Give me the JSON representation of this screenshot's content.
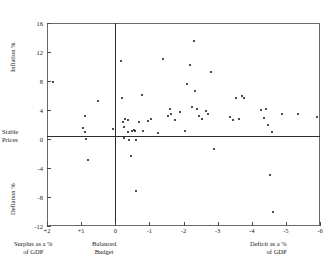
{
  "title": "",
  "axes": {
    "y_label_top": "Inflation %",
    "y_label_bottom": "Deflation %",
    "y_zero_label_line1": "Stable",
    "y_zero_label_line2": "Prices",
    "x_caption_left_line1": "Surplus as a %",
    "x_caption_left_line2": "of GDP",
    "x_caption_mid_line1": "Balanced",
    "x_caption_mid_line2": "Budget",
    "x_caption_right_line1": "Deficit as a %",
    "x_caption_right_line2": "of GDP",
    "x_ticks": [
      "+2",
      "+1",
      "0",
      "-1",
      "-2",
      "-3",
      "-4",
      "-5",
      "-6"
    ],
    "y_ticks": [
      "16",
      "12",
      "8",
      "4",
      "0",
      "-4",
      "-8",
      "-12"
    ]
  },
  "chart_data": {
    "type": "scatter",
    "title": "",
    "xlabel": "Budget balance as a % of GDP (surplus positive, deficit negative)",
    "ylabel": "Inflation / Deflation %",
    "xlim": [
      2,
      -6
    ],
    "ylim": [
      -12,
      16
    ],
    "x_ticks": [
      2,
      1,
      0,
      -1,
      -2,
      -3,
      -4,
      -5,
      -6
    ],
    "y_ticks": [
      16,
      12,
      8,
      4,
      0,
      -4,
      -8,
      -12
    ],
    "grid": false,
    "legend": "none",
    "reference_lines": [
      {
        "axis": "y",
        "value": 0,
        "label": "Stable Prices"
      },
      {
        "axis": "x",
        "value": 0,
        "label": "Balanced Budget"
      }
    ],
    "marker": "filled-circle",
    "marker_color": "#111111",
    "n_points": 77,
    "points": [
      [
        1.83,
        7.9
      ],
      [
        0.95,
        1.5
      ],
      [
        0.9,
        0.9
      ],
      [
        0.88,
        3.2
      ],
      [
        0.85,
        0.05
      ],
      [
        0.8,
        -2.9
      ],
      [
        0.52,
        5.3
      ],
      [
        0.06,
        1.4
      ],
      [
        -0.18,
        10.8
      ],
      [
        -0.2,
        5.7
      ],
      [
        -0.22,
        2.4
      ],
      [
        -0.25,
        1.7
      ],
      [
        -0.27,
        0.2
      ],
      [
        -0.3,
        2.8
      ],
      [
        -0.36,
        2.6
      ],
      [
        -0.38,
        1.0
      ],
      [
        -0.4,
        -0.2
      ],
      [
        -0.45,
        -2.3
      ],
      [
        -0.5,
        1.1
      ],
      [
        -0.55,
        1.2
      ],
      [
        -0.58,
        1.1
      ],
      [
        -0.6,
        -0.2
      ],
      [
        -0.62,
        -7.2
      ],
      [
        -0.7,
        2.4
      ],
      [
        -0.78,
        6.1
      ],
      [
        -0.8,
        1.1
      ],
      [
        -0.95,
        2.5
      ],
      [
        -1.05,
        2.8
      ],
      [
        -1.25,
        0.8
      ],
      [
        -1.4,
        11.1
      ],
      [
        -1.55,
        3.2
      ],
      [
        -1.6,
        4.2
      ],
      [
        -1.62,
        3.4
      ],
      [
        -1.75,
        2.6
      ],
      [
        -1.9,
        3.7
      ],
      [
        -2.05,
        1.1
      ],
      [
        -2.1,
        7.6
      ],
      [
        -2.18,
        10.2
      ],
      [
        -2.25,
        4.4
      ],
      [
        -2.3,
        13.5
      ],
      [
        -2.35,
        6.6
      ],
      [
        -2.4,
        4.1
      ],
      [
        -2.45,
        3.2
      ],
      [
        -2.55,
        2.7
      ],
      [
        -2.65,
        3.9
      ],
      [
        -2.72,
        3.5
      ],
      [
        -2.8,
        9.2
      ],
      [
        -2.88,
        -1.4
      ],
      [
        -3.35,
        3.0
      ],
      [
        -3.45,
        2.6
      ],
      [
        -3.55,
        5.6
      ],
      [
        -3.62,
        2.8
      ],
      [
        -3.7,
        6.0
      ],
      [
        -3.78,
        5.7
      ],
      [
        -4.28,
        4.0
      ],
      [
        -4.35,
        2.9
      ],
      [
        -4.42,
        4.1
      ],
      [
        -4.48,
        1.9
      ],
      [
        -4.52,
        -5.0
      ],
      [
        -4.58,
        0.9
      ],
      [
        -4.62,
        -10.1
      ],
      [
        -4.88,
        3.4
      ],
      [
        -5.35,
        3.4
      ],
      [
        -5.92,
        3.1
      ]
    ]
  }
}
